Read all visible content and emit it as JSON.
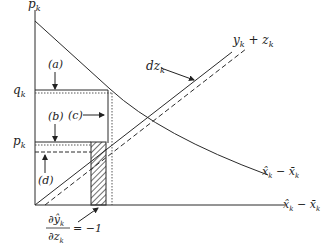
{
  "diagram": {
    "axes": {
      "y_label": "p_k",
      "y_label_main": "p",
      "y_label_sub": "k",
      "x_label": "x̂_k − x̄_k"
    },
    "levels": {
      "q": {
        "main": "q",
        "sub": "k"
      },
      "p": {
        "main": "p",
        "sub": "k"
      }
    },
    "annotations": {
      "a": "(a)",
      "b": "(b)",
      "c": "(c)",
      "d": "(d)",
      "dz": {
        "main": "dz",
        "sub": "k"
      },
      "yz": {
        "y": "y",
        "ysub": "k",
        "plus": " + ",
        "z": "z",
        "zsub": "k"
      },
      "curve_label": {
        "a": "x̂",
        "asub": "k",
        "minus": " − ",
        "b": "x̄",
        "bsub": "k"
      },
      "axis_label": {
        "a": "x̂",
        "asub": "k",
        "minus": " − ",
        "b": "x̄",
        "bsub": "k"
      },
      "derivative": {
        "num": "∂ŷ",
        "num_sub": "k",
        "den": "∂z",
        "den_sub": "k",
        "eq": "= −1"
      }
    },
    "colors": {
      "line": "#2a2a2a",
      "background": "#ffffff"
    }
  }
}
